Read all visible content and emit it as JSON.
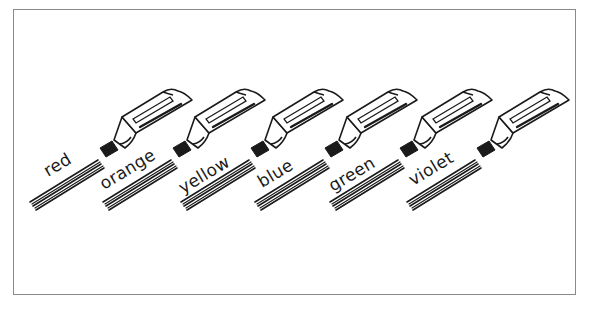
{
  "figure": {
    "markers": [
      {
        "label": "red"
      },
      {
        "label": "orange"
      },
      {
        "label": "yellow"
      },
      {
        "label": "blue"
      },
      {
        "label": "green"
      },
      {
        "label": "violet"
      }
    ]
  },
  "colors": {
    "ink": "#1a1a1a",
    "frame": "#8a8a8a",
    "background": "#ffffff"
  }
}
